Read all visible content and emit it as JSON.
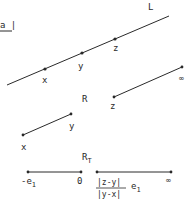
{
  "diagram": {
    "colors": {
      "ink": "#2a2a2a",
      "background": "#ffffff"
    },
    "fragment": {
      "text": "a |"
    },
    "line_L": {
      "label": "L",
      "points": [
        {
          "name": "x",
          "label": "x"
        },
        {
          "name": "y",
          "label": "y"
        },
        {
          "name": "z",
          "label": "z"
        }
      ]
    },
    "ray_R": {
      "label": "R",
      "start_label": "z",
      "end_label": "∞"
    },
    "segment_xy": {
      "start_label": "x",
      "end_label": "y"
    },
    "ray_RT": {
      "label": "R",
      "label_sub": "T",
      "left_segment": {
        "start_label": "-e",
        "start_sub": "1",
        "end_label": "0"
      },
      "right_segment": {
        "numerator": "|z-y|",
        "denominator": "|y-x|",
        "factor": "e",
        "factor_sub": "1",
        "end_label": "∞"
      }
    }
  }
}
